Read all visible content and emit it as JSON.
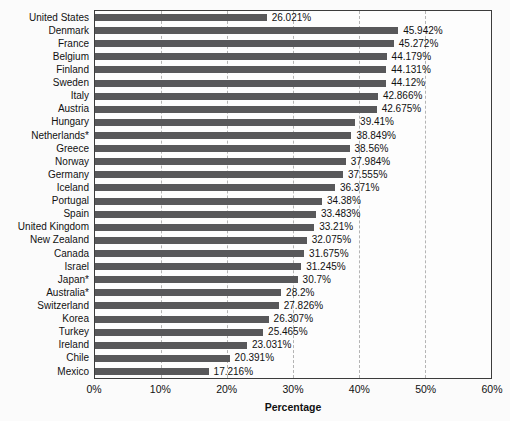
{
  "chart_data": {
    "type": "bar",
    "orientation": "horizontal",
    "title": "",
    "xlabel": "Percentage",
    "ylabel": "",
    "xlim": [
      0,
      60
    ],
    "xticks": [
      0,
      10,
      20,
      30,
      40,
      50,
      60
    ],
    "xtick_labels": [
      "0%",
      "10%",
      "20%",
      "30%",
      "40%",
      "50%",
      "60%"
    ],
    "grid": "vertical-dashed",
    "legend": "none",
    "bar_color": "#58585a",
    "plot_background": "#fdfdfd",
    "page_background": "#fbfbfb",
    "categories": [
      "United States",
      "Denmark",
      "France",
      "Belgium",
      "Finland",
      "Sweden",
      "Italy",
      "Austria",
      "Hungary",
      "Netherlands*",
      "Greece",
      "Norway",
      "Germany",
      "Iceland",
      "Portugal",
      "Spain",
      "United Kingdom",
      "New Zealand",
      "Canada",
      "Israel",
      "Japan*",
      "Australia*",
      "Switzerland",
      "Korea",
      "Turkey",
      "Ireland",
      "Chile",
      "Mexico"
    ],
    "values": [
      26.021,
      45.942,
      45.272,
      44.179,
      44.131,
      44.12,
      42.866,
      42.675,
      39.41,
      38.849,
      38.56,
      37.984,
      37.555,
      36.371,
      34.38,
      33.483,
      33.21,
      32.075,
      31.675,
      31.245,
      30.7,
      28.2,
      27.826,
      26.307,
      25.465,
      23.031,
      20.391,
      17.216
    ],
    "value_labels": [
      "26.021%",
      "45.942%",
      "45.272%",
      "44.179%",
      "44.131%",
      "44.12%",
      "42.866%",
      "42.675%",
      "39.41%",
      "38.849%",
      "38.56%",
      "37.984%",
      "37.555%",
      "36.371%",
      "34.38%",
      "33.483%",
      "33.21%",
      "32.075%",
      "31.675%",
      "31.245%",
      "30.7%",
      "28.2%",
      "27.826%",
      "26.307%",
      "25.465%",
      "23.031%",
      "20.391%",
      "17.216%"
    ]
  }
}
